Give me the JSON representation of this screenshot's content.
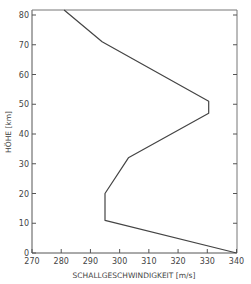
{
  "chart_data": {
    "type": "line",
    "title": "",
    "xlabel": "SCHALLGESCHWINDIGKEIT [m/s]",
    "ylabel": "HÖHE [km]",
    "xlim": [
      270,
      340
    ],
    "ylim": [
      0,
      82
    ],
    "xticks": [
      270,
      280,
      290,
      300,
      310,
      320,
      330,
      340
    ],
    "yticks": [
      0,
      10,
      20,
      30,
      40,
      50,
      60,
      70,
      80
    ],
    "grid": false,
    "legend": null,
    "series": [
      {
        "name": "Schallgeschwindigkeit",
        "x": [
          340,
          295,
          295,
          303,
          330.5,
          330.5,
          294,
          281
        ],
        "y": [
          0,
          11,
          20,
          32,
          47,
          51,
          71,
          82
        ]
      }
    ]
  }
}
